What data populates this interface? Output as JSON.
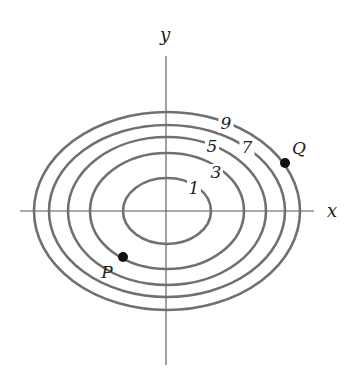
{
  "diagram": {
    "type": "contour-map",
    "axes": {
      "x_label": "x",
      "y_label": "y"
    },
    "contours": [
      {
        "level": "1",
        "cx": 167,
        "cy": 211,
        "rx": 44,
        "ry": 33,
        "label_x": 194,
        "label_y": 194,
        "gap_w": 14,
        "gap_h": 18
      },
      {
        "level": "3",
        "cx": 167,
        "cy": 211,
        "rx": 77,
        "ry": 58,
        "label_x": 216,
        "label_y": 178,
        "gap_w": 14,
        "gap_h": 18
      },
      {
        "level": "5",
        "cx": 167,
        "cy": 211,
        "rx": 99,
        "ry": 74,
        "label_x": 212,
        "label_y": 152,
        "gap_w": 14,
        "gap_h": 18
      },
      {
        "level": "7",
        "cx": 167,
        "cy": 211,
        "rx": 118,
        "ry": 86,
        "label_x": 247,
        "label_y": 153,
        "gap_w": 15,
        "gap_h": 18
      },
      {
        "level": "9",
        "cx": 167,
        "cy": 211,
        "rx": 133,
        "ry": 99,
        "label_x": 226,
        "label_y": 129,
        "gap_w": 15,
        "gap_h": 18
      }
    ],
    "points": [
      {
        "name": "P",
        "x": 123,
        "y": 257,
        "label_x": 107,
        "label_y": 278,
        "on_contour": "3"
      },
      {
        "name": "Q",
        "x": 285,
        "y": 163,
        "label_x": 299,
        "label_y": 154,
        "on_contour": "9"
      }
    ]
  }
}
